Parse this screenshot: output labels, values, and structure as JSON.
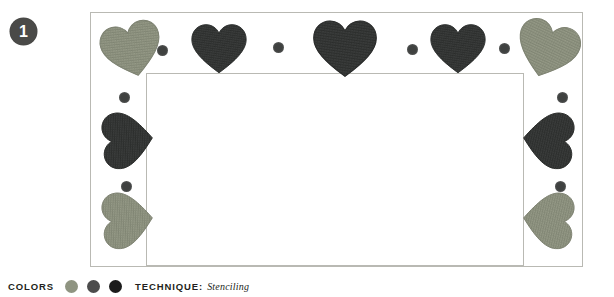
{
  "badge": {
    "number": "1"
  },
  "plate": {
    "frame": {
      "x": 90,
      "y": 12,
      "width": 493,
      "height": 255
    },
    "inner_rect": {
      "x": 55,
      "y": 60,
      "width": 378,
      "height": 193
    },
    "border_color": "#b9b9b3",
    "background": "#ffffff"
  },
  "caption": {
    "colors_label": "COLORS",
    "technique_label": "TECHNIQUE:",
    "technique_value": "Stenciling",
    "swatches": [
      {
        "name": "sage-green",
        "hex": "#8f9481"
      },
      {
        "name": "charcoal-gray",
        "hex": "#4c4c4c"
      },
      {
        "name": "near-black",
        "hex": "#1c1c1c"
      }
    ]
  },
  "motifs": {
    "palette": {
      "light": "#9a9e8b",
      "light_stroke": "#7e8372",
      "dark": "#3f4140",
      "dark_stroke": "#2a2c2b",
      "dot": "#3f4140",
      "dot_light": "#55564f"
    },
    "hearts": [
      {
        "id": "heart-top-1",
        "tone": "light",
        "x": 10,
        "y": 8,
        "w": 62,
        "h": 58,
        "rot": -14
      },
      {
        "id": "heart-top-2",
        "tone": "dark",
        "x": 95,
        "y": 10,
        "w": 66,
        "h": 52,
        "rot": 0
      },
      {
        "id": "heart-top-3",
        "tone": "dark",
        "x": 212,
        "y": 6,
        "w": 84,
        "h": 60,
        "rot": 0
      },
      {
        "id": "heart-top-4",
        "tone": "dark",
        "x": 334,
        "y": 10,
        "w": 66,
        "h": 52,
        "rot": 0
      },
      {
        "id": "heart-top-5",
        "tone": "light",
        "x": 424,
        "y": 7,
        "w": 64,
        "h": 60,
        "rot": 18
      },
      {
        "id": "heart-left-1",
        "tone": "dark",
        "x": 8,
        "y": 98,
        "w": 58,
        "h": 58,
        "rot": -95
      },
      {
        "id": "heart-left-2",
        "tone": "light",
        "x": 8,
        "y": 178,
        "w": 58,
        "h": 58,
        "rot": -95
      },
      {
        "id": "heart-right-1",
        "tone": "dark",
        "x": 428,
        "y": 98,
        "w": 58,
        "h": 58,
        "rot": 95
      },
      {
        "id": "heart-right-2",
        "tone": "light",
        "x": 428,
        "y": 178,
        "w": 58,
        "h": 58,
        "rot": 95
      }
    ],
    "dots": [
      {
        "id": "dot-top-1",
        "x": 66,
        "y": 32,
        "d": 11,
        "tone": "dark"
      },
      {
        "id": "dot-top-2",
        "x": 182,
        "y": 29,
        "d": 11,
        "tone": "dark"
      },
      {
        "id": "dot-top-3",
        "x": 316,
        "y": 31,
        "d": 11,
        "tone": "dark"
      },
      {
        "id": "dot-top-4",
        "x": 408,
        "y": 30,
        "d": 11,
        "tone": "dark"
      },
      {
        "id": "dot-left-1",
        "x": 28,
        "y": 79,
        "d": 11,
        "tone": "dark"
      },
      {
        "id": "dot-left-2",
        "x": 30,
        "y": 168,
        "d": 11,
        "tone": "dark"
      },
      {
        "id": "dot-right-1",
        "x": 466,
        "y": 79,
        "d": 11,
        "tone": "dark"
      },
      {
        "id": "dot-right-2",
        "x": 464,
        "y": 168,
        "d": 11,
        "tone": "dark"
      }
    ]
  }
}
